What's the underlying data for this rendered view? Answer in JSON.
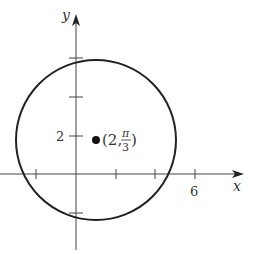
{
  "diagram": {
    "x_axis_label": "x",
    "y_axis_label": "y",
    "x_tick_label": "6",
    "y_tick_label": "2",
    "point_label_prefix": "(2, ",
    "point_label_num": "π",
    "point_label_den": "3",
    "point_label_suffix": ")",
    "circle": {
      "center_polar": "(2, π/3)",
      "radius": 4
    },
    "x_ticks": [
      -2,
      2,
      4,
      6
    ],
    "y_ticks": [
      2,
      4,
      6,
      -2
    ],
    "stroke_color": "#222222"
  }
}
